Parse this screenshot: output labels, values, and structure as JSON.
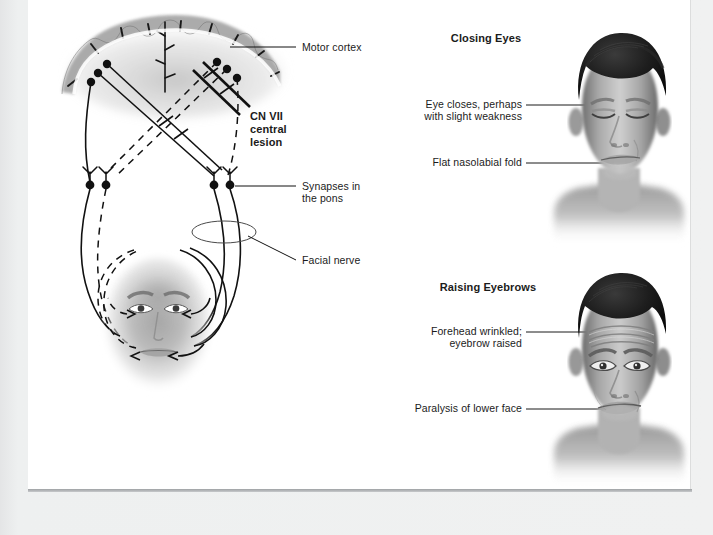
{
  "figure": {
    "background_color": "#eceded",
    "page_color": "#ffffff",
    "ink_color": "#111111"
  },
  "left_diagram": {
    "name": "corticobulbar-pathway-diagram",
    "labels": {
      "motor_cortex": "Motor cortex",
      "cn_vii_lesion_line1": "CN VII",
      "cn_vii_lesion_line2": "central",
      "cn_vii_lesion_line3": "lesion",
      "synapses_line1": "Synapses in",
      "synapses_line2": "the pons",
      "facial_nerve": "Facial nerve"
    },
    "structures": {
      "cortex": "cerebral cortex gyri cross-section",
      "upper_motor_neurons": "6 cell bodies in motor cortex",
      "pons_synapses": "4 synapse nodes in the pons",
      "facial_nerve_loop": "ellipse around facial nerve",
      "face": "female face schematic with nerve territories"
    }
  },
  "top_right_panel": {
    "name": "closing-eyes-panel",
    "heading": "Closing Eyes",
    "labels": [
      {
        "id": "eye-closes-label",
        "line1": "Eye closes, perhaps",
        "line2": "with slight weakness"
      },
      {
        "id": "flat-nasolabial-fold-label",
        "line1": "Flat nasolabial fold"
      }
    ],
    "image": "photograph of man with eyes closed"
  },
  "bottom_right_panel": {
    "name": "raising-eyebrows-panel",
    "heading": "Raising Eyebrows",
    "labels": [
      {
        "id": "forehead-wrinkled-label",
        "line1": "Forehead wrinkled;",
        "line2": "eyebrow raised"
      },
      {
        "id": "paralysis-lower-face-label",
        "line1": "Paralysis of lower face"
      }
    ],
    "image": "photograph of man raising eyebrows"
  }
}
